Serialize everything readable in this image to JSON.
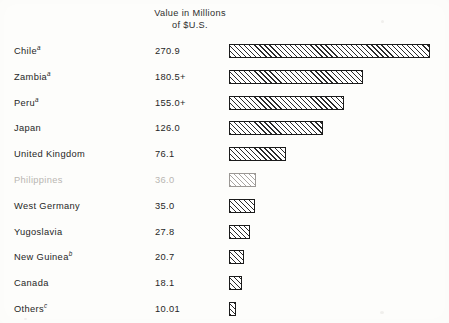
{
  "header": {
    "line1": "Value in Millions",
    "line2": "of $U.S."
  },
  "chart_data": {
    "type": "bar",
    "orientation": "horizontal",
    "title": "Value in Millions of $U.S.",
    "xlabel": "Value in Millions of $U.S.",
    "ylabel": "",
    "xlim": [
      0,
      270.9
    ],
    "grid": false,
    "legend": null,
    "axis_visible": false,
    "value_labels_shown": true,
    "categories": [
      "Chile",
      "Zambia",
      "Peru",
      "Japan",
      "United Kingdom",
      "Philippines",
      "West Germany",
      "Yugoslavia",
      "New Guinea",
      "Canada",
      "Others"
    ],
    "values": [
      270.9,
      180.5,
      155.0,
      126.0,
      76.1,
      36.0,
      35.0,
      27.8,
      20.7,
      18.1,
      10.01
    ],
    "value_text": [
      "270.9",
      "180.5+",
      "155.0+",
      "126.0",
      "76.1",
      "36.0",
      "35.0",
      "27.8",
      "20.7",
      "18.1",
      "10.01"
    ],
    "category_footnotes": [
      "a",
      "a",
      "a",
      "",
      "",
      "",
      "",
      "",
      "b",
      "",
      "c"
    ],
    "rows": [
      {
        "label": "Chile",
        "footnote": "a",
        "value": 270.9,
        "value_text": "270.9",
        "faded": false
      },
      {
        "label": "Zambia",
        "footnote": "a",
        "value": 180.5,
        "value_text": "180.5+",
        "faded": false
      },
      {
        "label": "Peru",
        "footnote": "a",
        "value": 155.0,
        "value_text": "155.0+",
        "faded": false
      },
      {
        "label": "Japan",
        "footnote": "",
        "value": 126.0,
        "value_text": "126.0",
        "faded": false
      },
      {
        "label": "United Kingdom",
        "footnote": "",
        "value": 76.1,
        "value_text": "76.1",
        "faded": false
      },
      {
        "label": "Philippines",
        "footnote": "",
        "value": 36.0,
        "value_text": "36.0",
        "faded": true
      },
      {
        "label": "West Germany",
        "footnote": "",
        "value": 35.0,
        "value_text": "35.0",
        "faded": false
      },
      {
        "label": "Yugoslavia",
        "footnote": "",
        "value": 27.8,
        "value_text": "27.8",
        "faded": false
      },
      {
        "label": "New Guinea",
        "footnote": "b",
        "value": 20.7,
        "value_text": "20.7",
        "faded": false
      },
      {
        "label": "Canada",
        "footnote": "",
        "value": 18.1,
        "value_text": "18.1",
        "faded": false
      },
      {
        "label": "Others",
        "footnote": "c",
        "value": 10.01,
        "value_text": "10.01",
        "faded": false
      }
    ]
  },
  "style": {
    "bar_fill": "#ffffff",
    "bar_hatch": "#2a2a2a",
    "bar_border": "#1b1b1b",
    "text": "#262626",
    "background": "#fdfdfb",
    "px_per_unit": 0.742,
    "bar_origin_x": 229
  }
}
